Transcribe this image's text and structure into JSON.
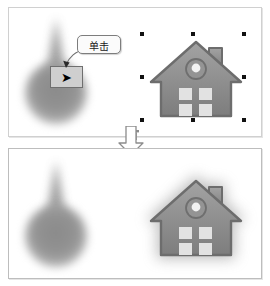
{
  "figure": {
    "type": "before-after-illustration",
    "background_color": "#ffffff",
    "panel_border_color": "#c9c9c9"
  },
  "panels": {
    "before": {
      "name": "before-panel",
      "objects": {
        "blob": {
          "name": "teardrop-blob",
          "color": "#8d8d8d",
          "label": ""
        },
        "arrow_button": {
          "name": "arrow-button",
          "glyph": "➡",
          "icon": "right-arrow-icon",
          "fill": "#cfcfcf",
          "border": "#6f6f6f"
        },
        "callout": {
          "name": "click-callout",
          "text": "单击",
          "border_color": "#7d7d7d",
          "fill": "#fbfbfb"
        },
        "house": {
          "name": "house-clipart",
          "selected": true,
          "handle_color": "#111111",
          "handle_count": 8,
          "body_color": "#8e8e8e",
          "window_color": "#e2e2e2"
        }
      }
    },
    "after": {
      "name": "after-panel",
      "objects": {
        "blob": {
          "name": "teardrop-blob",
          "color": "#8d8d8d"
        },
        "house": {
          "name": "house-clipart",
          "selected": false,
          "effect": "soft-glow-shadow",
          "glow_color": "#9a9a9a",
          "body_color": "#8e8e8e",
          "window_color": "#e2e2e2"
        }
      }
    }
  },
  "connector": {
    "name": "down-arrow-connector",
    "icon": "arrow-down-icon",
    "fill": "#ffffff",
    "stroke": "#8c8c8c"
  }
}
